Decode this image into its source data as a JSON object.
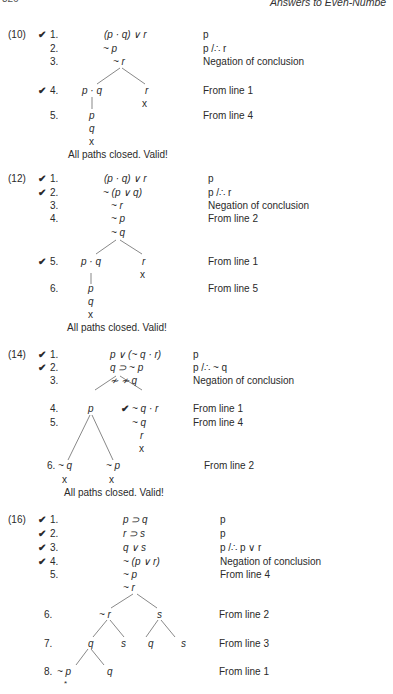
{
  "header": {
    "page_number": "326",
    "running_title": "Answers to Even-Numbe"
  },
  "problems": [
    {
      "label": "(10)",
      "lines": [
        {
          "num": "1.",
          "checked": true,
          "formula": "(p · q) ∨ r",
          "just": "p"
        },
        {
          "num": "2.",
          "checked": false,
          "formula": "~ p",
          "just": "p /∴ r"
        },
        {
          "num": "3.",
          "checked": false,
          "formula": "~ r",
          "just": "Negation of conclusion"
        },
        {
          "num": "4.",
          "checked": true,
          "formula_left": "p · q",
          "formula_right": "r",
          "just": "From line 1"
        },
        {
          "num": "5.",
          "checked": false,
          "formula": "p",
          "just": "From line 4"
        }
      ],
      "extra": [
        "q",
        "x"
      ],
      "closed_marks": [
        "x",
        "x"
      ],
      "conclusion": "All paths closed. Valid!"
    },
    {
      "label": "(12)",
      "lines": [
        {
          "num": "1.",
          "checked": true,
          "formula": "(p · q) ∨ r",
          "just": "p"
        },
        {
          "num": "2.",
          "checked": true,
          "formula": "~ (p ∨ q)",
          "just": "p /∴ r"
        },
        {
          "num": "3.",
          "checked": false,
          "formula": "~ r",
          "just": "Negation of conclusion"
        },
        {
          "num": "4.",
          "checked": false,
          "formula": "~ p",
          "just": "From line 2"
        },
        {
          "num": "",
          "checked": false,
          "formula": "~ q",
          "just": ""
        },
        {
          "num": "5.",
          "checked": true,
          "formula_left": "p · q",
          "formula_right": "r",
          "just": "From line 1"
        },
        {
          "num": "6.",
          "checked": false,
          "formula": "p",
          "just": "From line 5"
        }
      ],
      "extra": [
        "q",
        "x"
      ],
      "closed_marks": [
        "x",
        "x"
      ],
      "conclusion": "All paths closed. Valid!"
    },
    {
      "label": "(14)",
      "lines": [
        {
          "num": "1.",
          "checked": true,
          "formula": "p ∨ (~ q · r)",
          "just": "p"
        },
        {
          "num": "2.",
          "checked": true,
          "formula": "q ⊃ ~ p",
          "just": "p /∴ ~ q"
        },
        {
          "num": "3.",
          "checked": false,
          "formula": "≁ ≁ q",
          "just": "Negation of conclusion"
        },
        {
          "num": "4.",
          "checked": false,
          "formula_left": "p",
          "formula_right": "~ q · r",
          "right_checked": true,
          "just": "From line 1"
        },
        {
          "num": "5.",
          "checked": false,
          "formula": "~ q",
          "just": "From line 4"
        },
        {
          "num": "6.",
          "checked": false,
          "formula_left": "~ q",
          "formula_right": "~ p",
          "just": "From line 2"
        }
      ],
      "extra": [
        "r",
        "x"
      ],
      "closed_marks": [
        "x",
        "x",
        "x"
      ],
      "conclusion": "All paths closed. Valid!"
    },
    {
      "label": "(16)",
      "lines": [
        {
          "num": "1.",
          "checked": true,
          "formula": "p ⊃ q",
          "just": "p"
        },
        {
          "num": "2.",
          "checked": true,
          "formula": "r ⊃ s",
          "just": "p"
        },
        {
          "num": "3.",
          "checked": true,
          "formula": "q ∨ s",
          "just": "p /∴ p ∨ r"
        },
        {
          "num": "4.",
          "checked": true,
          "formula": "~ (p ∨ r)",
          "just": "Negation of conclusion"
        },
        {
          "num": "5.",
          "checked": false,
          "formula": "~ p",
          "just": "From line 4"
        },
        {
          "num": "",
          "checked": false,
          "formula": "~ r",
          "just": ""
        },
        {
          "num": "6.",
          "checked": false,
          "formula_left": "~ r",
          "formula_right": "s",
          "just": "From line 2"
        },
        {
          "num": "7.",
          "checked": false,
          "nodes": [
            "q",
            "s",
            "q",
            "s"
          ],
          "just": "From line 3"
        },
        {
          "num": "8.",
          "checked": false,
          "formula_left": "~ p",
          "formula_right": "q",
          "just": "From line 1"
        }
      ],
      "open_mark": "*"
    }
  ],
  "symbols": {
    "check": "✔"
  }
}
